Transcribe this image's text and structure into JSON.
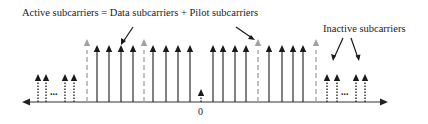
{
  "labels": {
    "active": "Active subcarriers = Data subcarriers + Pilot subcarriers",
    "inactive": "Inactive subcarriers",
    "zero": "0",
    "ellipsis_left": "...",
    "ellipsis_right": "..."
  },
  "colors": {
    "axis": "#333333",
    "data_arrow": "#1a1a1a",
    "pilot": "#a0a0a0",
    "inactive": "#1a1a1a"
  },
  "subcarriers": {
    "inactive_left_x": [
      38,
      46,
      65,
      74
    ],
    "pilot_x": [
      87,
      144,
      258,
      316
    ],
    "data_x": [
      97,
      109,
      121,
      133,
      153,
      166,
      178,
      190,
      213,
      223,
      235,
      246,
      269,
      282,
      293,
      303
    ],
    "dc_x": 201,
    "inactive_right_x": [
      327,
      337,
      356,
      365
    ]
  }
}
